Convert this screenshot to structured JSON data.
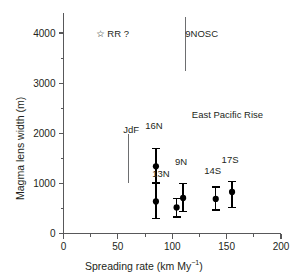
{
  "chart_data": {
    "type": "scatter",
    "title": "",
    "xlabel": "Spreading rate (km My−1)",
    "xlabel_base": "Spreading rate (km My",
    "xlabel_sup": "−1",
    "xlabel_tail": ")",
    "ylabel": "Magma lens width (m)",
    "xlim": [
      0,
      200
    ],
    "ylim": [
      0,
      4400
    ],
    "xticks": [
      0,
      50,
      100,
      150,
      200
    ],
    "xticklabels": [
      "0",
      "50",
      "100",
      "150",
      "200"
    ],
    "xminorticks": [
      25,
      75,
      125,
      175
    ],
    "yticks": [
      0,
      1000,
      2000,
      3000,
      4000
    ],
    "yticklabels": [
      "0",
      "1000",
      "2000",
      "3000",
      "4000"
    ],
    "yminorticks": [
      500,
      1500,
      2500,
      3500
    ],
    "grid": false,
    "legend": "none",
    "marker": "filled-circle",
    "series": [
      {
        "name": "East Pacific Rise magma lens widths",
        "points": [
          {
            "label": "16N",
            "x": 85,
            "y": 1340,
            "yerr_low": 1010,
            "yerr_high": 1700,
            "label_dx": -2,
            "label_dy": -28
          },
          {
            "label": "13N",
            "x": 85,
            "y": 640,
            "yerr_low": 300,
            "yerr_high": 1020,
            "label_dx": 5,
            "label_dy": -14
          },
          {
            "label": "9N",
            "x": 110,
            "y": 710,
            "yerr_low": 440,
            "yerr_high": 1000,
            "label_dx": -2,
            "label_dy": -27
          },
          {
            "label": "",
            "x": 104,
            "y": 520,
            "yerr_low": 330,
            "yerr_high": 700,
            "label_dx": 0,
            "label_dy": 0
          },
          {
            "label": "14S",
            "x": 140,
            "y": 690,
            "yerr_low": 470,
            "yerr_high": 930,
            "label_dx": -3,
            "label_dy": -22
          },
          {
            "label": "17S",
            "x": 155,
            "y": 830,
            "yerr_low": 520,
            "yerr_high": 1040,
            "label_dx": -2,
            "label_dy": -27
          }
        ]
      }
    ],
    "annotations": [
      {
        "name": "rr-star",
        "text": "☆ RR ?",
        "x": 30,
        "y": 4000,
        "kind": "star-label"
      },
      {
        "name": "9nosc",
        "text": "9NOSC",
        "x": 112,
        "y": 4000,
        "kind": "text"
      },
      {
        "name": "epr",
        "text": "East Pacific Rise",
        "x": 118,
        "y": 2380,
        "kind": "text"
      },
      {
        "name": "jdf",
        "text": "JdF",
        "x": 55,
        "y": 2080,
        "kind": "text"
      }
    ],
    "range_bars": [
      {
        "name": "9NOSC-range",
        "x": 112,
        "y_top": 4320,
        "y_bottom": 3240
      },
      {
        "name": "JdF-range",
        "x": 60,
        "y_top": 1980,
        "y_bottom": 1000
      }
    ]
  },
  "axis": {
    "x_title_base": "Spreading rate (km My",
    "x_title_sup": "−1",
    "x_title_tail": ")",
    "y_title": "Magma lens width (m)"
  },
  "colors": {
    "axis": "#58585a",
    "text": "#231f20",
    "marker": "#000000"
  }
}
